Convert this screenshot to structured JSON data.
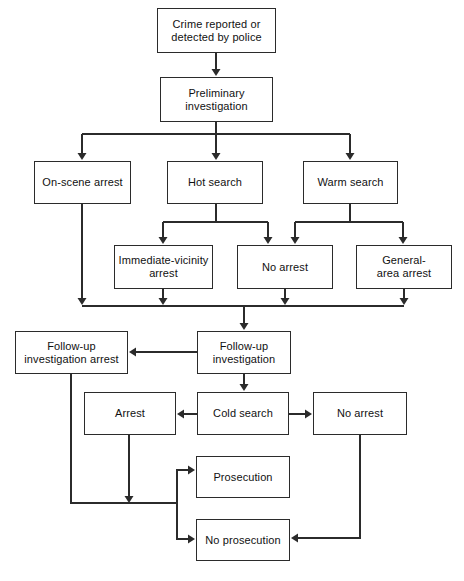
{
  "diagram": {
    "background_color": "#ffffff",
    "line_color": "#2b2b2b",
    "text_color": "#111111",
    "nodes": [
      {
        "id": "crime_reported",
        "label": "Crime reported or detected by police",
        "x": 157,
        "y": 8,
        "w": 119,
        "h": 45
      },
      {
        "id": "prelim",
        "label": "Preliminary investigation",
        "x": 160,
        "y": 77,
        "w": 113,
        "h": 45
      },
      {
        "id": "onscene",
        "label": "On-scene arrest",
        "x": 34,
        "y": 161,
        "w": 97,
        "h": 43
      },
      {
        "id": "hot",
        "label": "Hot search",
        "x": 167,
        "y": 161,
        "w": 96,
        "h": 43
      },
      {
        "id": "warm",
        "label": "Warm search",
        "x": 303,
        "y": 161,
        "w": 95,
        "h": 43
      },
      {
        "id": "immediate",
        "label": "Immediate-vicinity arrest",
        "x": 114,
        "y": 245,
        "w": 99,
        "h": 44
      },
      {
        "id": "noarrest1",
        "label": "No arrest",
        "x": 237,
        "y": 245,
        "w": 96,
        "h": 44
      },
      {
        "id": "general",
        "label": "General- area arrest",
        "x": 356,
        "y": 245,
        "w": 96,
        "h": 44
      },
      {
        "id": "followup_arrest",
        "label": "Follow-up investigation arrest",
        "x": 15,
        "y": 331,
        "w": 113,
        "h": 43
      },
      {
        "id": "followup",
        "label": "Follow-up investigation",
        "x": 197,
        "y": 331,
        "w": 94,
        "h": 43
      },
      {
        "id": "arrest2",
        "label": "Arrest",
        "x": 84,
        "y": 392,
        "w": 92,
        "h": 43
      },
      {
        "id": "cold",
        "label": "Cold search",
        "x": 197,
        "y": 392,
        "w": 92,
        "h": 43
      },
      {
        "id": "noarrest2",
        "label": "No arrest",
        "x": 313,
        "y": 392,
        "w": 94,
        "h": 43
      },
      {
        "id": "prosecution",
        "label": "Prosecution",
        "x": 196,
        "y": 456,
        "w": 94,
        "h": 42
      },
      {
        "id": "noprosecution",
        "label": "No prosecution",
        "x": 196,
        "y": 519,
        "w": 94,
        "h": 42
      }
    ],
    "node_label_lines": {
      "crime_reported": [
        "Crime reported or",
        "detected by police"
      ],
      "prelim": [
        "Preliminary",
        "investigation"
      ],
      "onscene": [
        "On-scene arrest"
      ],
      "hot": [
        "Hot search"
      ],
      "warm": [
        "Warm search"
      ],
      "immediate": [
        "Immediate-vicinity",
        "arrest"
      ],
      "noarrest1": [
        "No arrest"
      ],
      "general": [
        "General-",
        "area arrest"
      ],
      "followup_arrest": [
        "Follow-up",
        "investigation arrest"
      ],
      "followup": [
        "Follow-up",
        "investigation"
      ],
      "arrest2": [
        "Arrest"
      ],
      "cold": [
        "Cold search"
      ],
      "noarrest2": [
        "No arrest"
      ],
      "prosecution": [
        "Prosecution"
      ],
      "noprosecution": [
        "No prosecution"
      ]
    },
    "edges": [
      {
        "id": "e1",
        "from": "crime_reported",
        "to": "prelim",
        "path": "M 216 53 L 216 70",
        "arrow_at": [
          216,
          76
        ]
      },
      {
        "id": "e2",
        "from": "prelim",
        "to": "bus1",
        "path": "M 216 122 L 216 134 M 82 134 L 350 134",
        "arrow_at": null
      },
      {
        "id": "e3",
        "from": "bus1",
        "to": "onscene",
        "path": "M 82 134 L 82 154",
        "arrow_at": [
          82,
          160
        ]
      },
      {
        "id": "e4",
        "from": "bus1",
        "to": "hot",
        "path": "M 216 134 L 216 154",
        "arrow_at": [
          216,
          160
        ]
      },
      {
        "id": "e5",
        "from": "bus1",
        "to": "warm",
        "path": "M 350 134 L 350 154",
        "arrow_at": [
          350,
          160
        ]
      },
      {
        "id": "e6",
        "from": "hot",
        "to": "bus2",
        "path": "M 216 204 L 216 222 M 163 222 L 268 222",
        "arrow_at": null
      },
      {
        "id": "e7",
        "from": "bus2",
        "to": "immediate",
        "path": "M 163 222 L 163 238",
        "arrow_at": [
          163,
          244
        ]
      },
      {
        "id": "e8",
        "from": "bus2",
        "to": "noarrest1_left",
        "path": "M 268 222 L 268 238",
        "arrow_at": [
          268,
          244
        ]
      },
      {
        "id": "e9",
        "from": "warm",
        "to": "bus3",
        "path": "M 350 204 L 350 222 M 295 222 L 403 222",
        "arrow_at": null
      },
      {
        "id": "e10",
        "from": "bus3",
        "to": "noarrest1_right",
        "path": "M 295 222 L 295 238",
        "arrow_at": [
          295,
          244
        ]
      },
      {
        "id": "e11",
        "from": "bus3",
        "to": "general",
        "path": "M 403 222 L 403 238",
        "arrow_at": [
          403,
          244
        ]
      },
      {
        "id": "e12",
        "from": "onscene",
        "to": "bus4",
        "path": "M 82 204 L 82 299",
        "arrow_at": [
          82,
          305
        ]
      },
      {
        "id": "e13",
        "from": "immediate",
        "to": "bus4",
        "path": "M 163 289 L 163 299",
        "arrow_at": [
          163,
          305
        ]
      },
      {
        "id": "e14",
        "from": "noarrest1",
        "to": "bus4",
        "path": "M 285 289 L 285 299",
        "arrow_at": [
          285,
          305
        ]
      },
      {
        "id": "e15",
        "from": "general",
        "to": "bus4",
        "path": "M 404 289 L 404 299",
        "arrow_at": [
          404,
          305
        ]
      },
      {
        "id": "e16",
        "from": "bus4",
        "to": "followup",
        "path": "M 82 306 L 404 306 M 244 306 L 244 324",
        "arrow_at": [
          244,
          330
        ]
      },
      {
        "id": "e17",
        "from": "followup",
        "to": "followup_arrest",
        "path": "M 197 352 L 136 352",
        "arrow_at": [
          129,
          352
        ]
      },
      {
        "id": "e18",
        "from": "followup",
        "to": "cold",
        "path": "M 244 374 L 244 385",
        "arrow_at": [
          244,
          391
        ]
      },
      {
        "id": "e19",
        "from": "cold",
        "to": "arrest2",
        "path": "M 197 414 L 184 414",
        "arrow_at": [
          177,
          414
        ]
      },
      {
        "id": "e20",
        "from": "cold",
        "to": "noarrest2",
        "path": "M 289 414 L 305 414",
        "arrow_at": [
          312,
          414
        ]
      },
      {
        "id": "e21",
        "from": "followup_arrest",
        "to": "junction",
        "path": "M 71 374 L 71 503 L 177 503",
        "arrow_at": null
      },
      {
        "id": "e22",
        "from": "arrest2",
        "to": "junction",
        "path": "M 129 435 L 129 497",
        "arrow_at": [
          129,
          503
        ]
      },
      {
        "id": "e23",
        "from": "junction",
        "to": "prosecution",
        "path": "M 177 503 L 177 470 L 188 470",
        "arrow_at": [
          195,
          470
        ]
      },
      {
        "id": "e24",
        "from": "junction",
        "to": "noprosecution",
        "path": "M 177 503 L 177 539 L 188 539",
        "arrow_at": [
          195,
          539
        ]
      },
      {
        "id": "e25",
        "from": "noarrest2",
        "to": "noprosecution",
        "path": "M 360 435 L 360 538 L 298 538",
        "arrow_at": [
          291,
          538
        ]
      }
    ]
  }
}
